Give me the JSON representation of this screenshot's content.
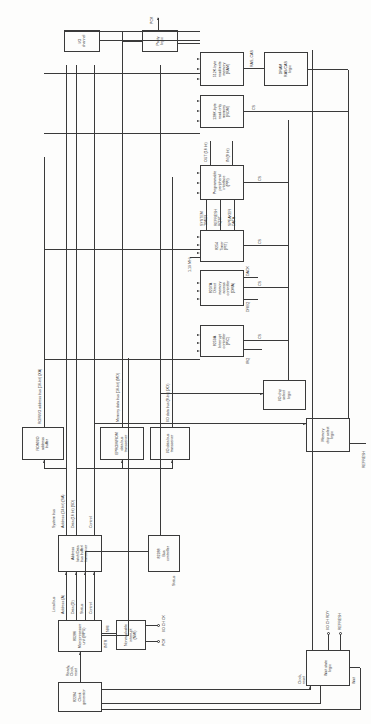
{
  "diagram": {
    "orientation": "rotated-90-ccw",
    "blocks": {
      "clock_generator": "82284\nClock\ngenerator",
      "cpu": "80286\nMicroprocessor\nunit (MPU)",
      "nmi_logic": "Nonmaskable\ninterrupt\n(NMI)",
      "latch_transceiver": "Address\nlatch/Data\nbus buffer/\ntransceiver",
      "bus_controller": "82288\nBus\ncontroller",
      "rom_io_address_buffer": "ROM/I/O\naddress\nbuffer",
      "eprom_data_transceiver": "EPROM/ROM\ndata bus\ntransceiver",
      "io_data_transceiver": "I/O data bus\ntransceiver",
      "io_chip_select": "I/O chip\nselect\nlogic",
      "memory_chip_select": "Memory\nchip select\nlogic",
      "wait_state_logic": "Wait state\nlogic",
      "pic": "8259A\nInterrupt\ncontroller\n(PIC)",
      "dma": "8237A\nDirect\nmemory\naccess\ncontroller\n(DMA)",
      "pit": "8254\nTimer\n(PIT)",
      "ppi": "Programmable\nperipheral\ninterface\n(PPI)",
      "rom": "128K-byte\nread-only\nmemory\n(ROM)",
      "ram": "512K-byte\nread/write\nmemory\n(RAM)",
      "dram_logic": "DRAM\nRAS/CAS\nlogic",
      "parity_logic": "Parity\nlogic",
      "io_channel": "I/O\nchannel"
    },
    "bus_labels": {
      "local_bus": "Local bus",
      "local_address": "Address (A)",
      "local_data": "Data (D)",
      "local_status": "Status",
      "local_control": "Control",
      "system_bus": "System bus",
      "system_address": "Address (24 bit) (SA)",
      "system_data": "Data (16 bit) (SD)",
      "system_control": "Control",
      "rom_io_address_bus": "ROM/I/O address bus (16-bit) (XA)",
      "memory_data_bus": "Memory data bus (16-bit) (MD)",
      "io_data_bus": "I/O data bus (8-bit) (XD)"
    },
    "signals": {
      "ready_clock_reset": "Ready,\nClock,\nreset",
      "intr": "INTR",
      "nmi": "NMI",
      "pck": "PCK",
      "io_ch_ck": "I/O CH CK",
      "status": "Status",
      "clock_reset": "Clock,\nreset",
      "wait": "Wait",
      "io_ch_rdy": "I/O CH RDY",
      "refresh_wait": "REFRESH",
      "refresh_mem": "REFRESH",
      "irq": "IRQ",
      "dreq": "DREQ",
      "dack": "DACK",
      "clk_119": "1.19 MHz",
      "system_timer": "SYSTEM\nTIMER",
      "refresh_rqst": "REFRESH\nRQST",
      "speaker_data": "SPEAKER\nDATA",
      "out_16": "OUT (16 bit)",
      "in_8": "IN (8 bit)",
      "cs": "CS",
      "ras_cas": "RAS, CAS",
      "pck_parity": "PCK"
    }
  }
}
